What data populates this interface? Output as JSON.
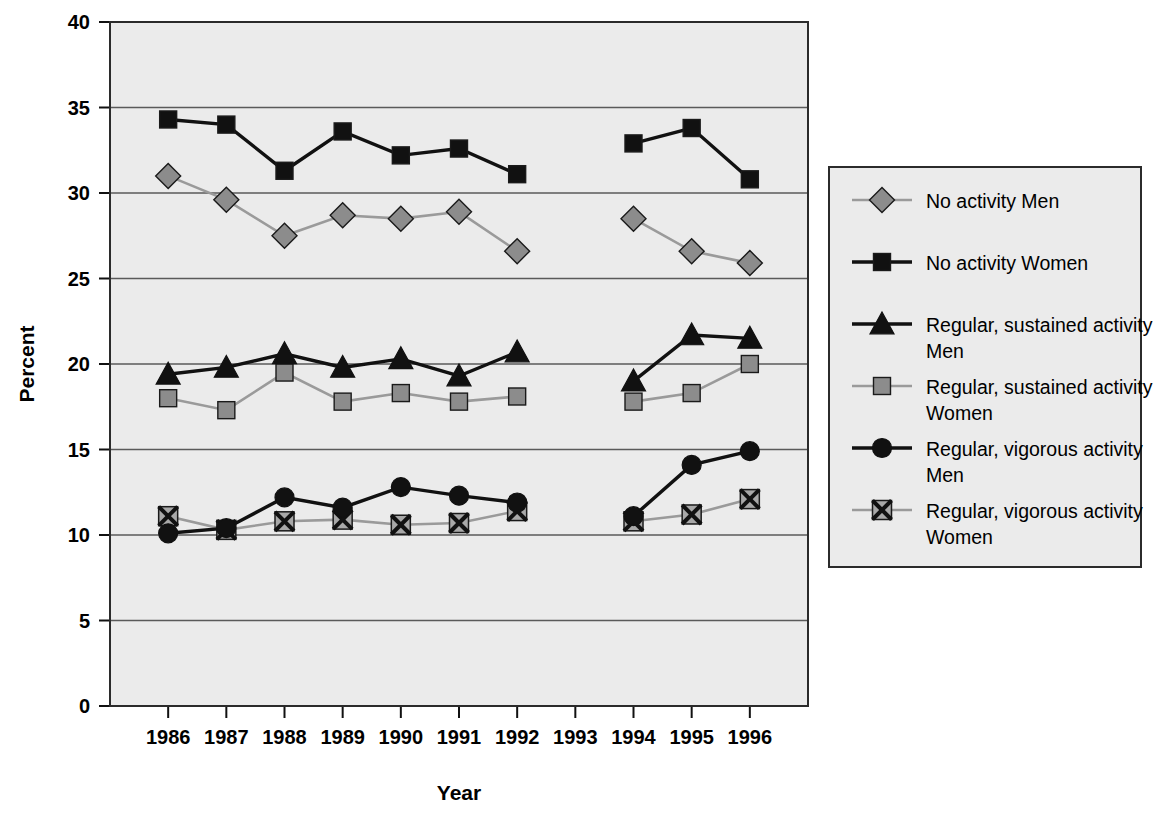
{
  "chart_data": {
    "type": "line",
    "title": "",
    "xlabel": "Year",
    "ylabel": "Percent",
    "categories": [
      1986,
      1987,
      1988,
      1989,
      1990,
      1991,
      1992,
      1993,
      1994,
      1995,
      1996
    ],
    "x_tick_labels": [
      "1986",
      "1987",
      "1988",
      "1989",
      "1990",
      "1991",
      "1992",
      "1993",
      "1994",
      "1995",
      "1996"
    ],
    "y_tick_labels": [
      "0",
      "5",
      "10",
      "15",
      "20",
      "25",
      "30",
      "35",
      "40"
    ],
    "y_ticks": [
      0,
      5,
      10,
      15,
      20,
      25,
      30,
      35,
      40
    ],
    "ylim": [
      0,
      40
    ],
    "grid": "horizontal",
    "legend_position": "right",
    "missing_year": 1993,
    "series": [
      {
        "name": "No activity Men",
        "marker": "diamond",
        "marker_fill": "#8c8c8c",
        "line_color": "#9a9a9a",
        "values": [
          31.0,
          29.6,
          27.5,
          28.7,
          28.5,
          28.9,
          26.6,
          null,
          28.5,
          26.6,
          25.9
        ]
      },
      {
        "name": "No activity Women",
        "marker": "square",
        "marker_fill": "#111111",
        "line_color": "#111111",
        "values": [
          34.3,
          34.0,
          31.3,
          33.6,
          32.2,
          32.6,
          31.1,
          null,
          32.9,
          33.8,
          30.8
        ]
      },
      {
        "name": "Regular, sustained activity Men",
        "marker": "triangle",
        "marker_fill": "#111111",
        "line_color": "#111111",
        "values": [
          19.4,
          19.8,
          20.6,
          19.8,
          20.3,
          19.3,
          20.7,
          null,
          19.0,
          21.7,
          21.5
        ]
      },
      {
        "name": "Regular, sustained activity Women",
        "marker": "square",
        "marker_fill": "#8c8c8c",
        "line_color": "#9a9a9a",
        "values": [
          18.0,
          17.3,
          19.5,
          17.8,
          18.3,
          17.8,
          18.1,
          null,
          17.8,
          18.3,
          20.0
        ]
      },
      {
        "name": "Regular, vigorous activity Men",
        "marker": "circle",
        "marker_fill": "#111111",
        "line_color": "#111111",
        "values": [
          10.1,
          10.4,
          12.2,
          11.6,
          12.8,
          12.3,
          11.9,
          null,
          11.1,
          14.1,
          14.9
        ]
      },
      {
        "name": "Regular, vigorous activity Women",
        "marker": "crossed-square",
        "marker_fill": "#a8a8a8",
        "line_color": "#9a9a9a",
        "values": [
          11.1,
          10.3,
          10.8,
          10.9,
          10.6,
          10.7,
          11.4,
          null,
          10.8,
          11.2,
          12.1
        ]
      }
    ]
  },
  "legend": {
    "entries": [
      {
        "label": "No activity Men"
      },
      {
        "label": "No activity Women"
      },
      {
        "label": "Regular, sustained activity",
        "label2": "Men"
      },
      {
        "label": "Regular, sustained activity",
        "label2": "Women"
      },
      {
        "label": "Regular, vigorous activity",
        "label2": "Men"
      },
      {
        "label": "Regular, vigorous activity",
        "label2": "Women"
      }
    ]
  },
  "colors": {
    "plot_background": "#ebebeb",
    "legend_background": "#ebebeb",
    "frame": "#2b2b2b",
    "gridline": "#5a5a5a",
    "black_series": "#111111",
    "gray_series": "#9a9a9a",
    "gray_marker_fill": "#8c8c8c"
  }
}
